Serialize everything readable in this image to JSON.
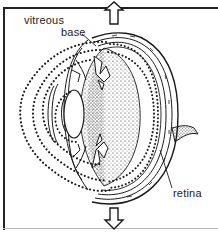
{
  "figure": {
    "type": "anatomical cross-section of the eye",
    "labels": {
      "vitreous": "vitreous",
      "base": "base",
      "retina": "retina"
    },
    "arrows": {
      "top": "arrow-up",
      "bottom": "arrow-down"
    },
    "colors": {
      "ink": "#1a1a1a",
      "background": "#ffffff",
      "frame_bottom": "#bbbbbb"
    }
  }
}
